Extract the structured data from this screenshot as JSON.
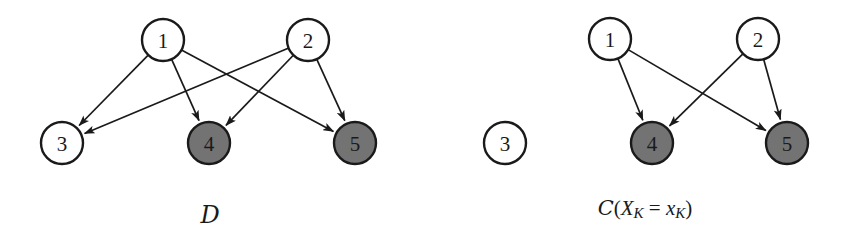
{
  "figure": {
    "background_color": "#ffffff",
    "stroke_color": "#1a1a1a",
    "observed_fill_color": "#737373",
    "unobserved_fill_color": "#ffffff",
    "node_radius": 21,
    "panels": [
      {
        "id": "panel-dag",
        "caption": "D",
        "caption_style": "calligraphic",
        "caption_x": 210,
        "caption_y": 215,
        "nodes": [
          {
            "id": "1",
            "label": "1",
            "x": 163,
            "y": 40,
            "shaded": false
          },
          {
            "id": "2",
            "label": "2",
            "x": 308,
            "y": 40,
            "shaded": false
          },
          {
            "id": "3",
            "label": "3",
            "x": 62,
            "y": 143,
            "shaded": false
          },
          {
            "id": "4",
            "label": "4",
            "x": 209,
            "y": 143,
            "shaded": true
          },
          {
            "id": "5",
            "label": "5",
            "x": 355,
            "y": 143,
            "shaded": true
          }
        ],
        "edges": [
          {
            "from": "1",
            "to": "3",
            "directed": true
          },
          {
            "from": "1",
            "to": "4",
            "directed": true
          },
          {
            "from": "1",
            "to": "5",
            "directed": true
          },
          {
            "from": "2",
            "to": "3",
            "directed": true
          },
          {
            "from": "2",
            "to": "4",
            "directed": true
          },
          {
            "from": "2",
            "to": "5",
            "directed": true
          }
        ]
      },
      {
        "id": "panel-intervened",
        "caption_parts": {
          "script_c": "C",
          "open_paren": "(",
          "var_upper": "X",
          "sub_upper": "K",
          "equals": " = ",
          "var_lower": "x",
          "sub_lower": "K",
          "close_paren": ")"
        },
        "caption_text": "C(X_K = x_K)",
        "caption_x": 645,
        "caption_y": 208,
        "nodes": [
          {
            "id": "1",
            "label": "1",
            "x": 610,
            "y": 39,
            "shaded": false
          },
          {
            "id": "2",
            "label": "2",
            "x": 758,
            "y": 39,
            "shaded": false
          },
          {
            "id": "3",
            "label": "3",
            "x": 505,
            "y": 143,
            "shaded": false
          },
          {
            "id": "4",
            "label": "4",
            "x": 652,
            "y": 143,
            "shaded": true
          },
          {
            "id": "5",
            "label": "5",
            "x": 787,
            "y": 143,
            "shaded": true
          }
        ],
        "edges": [
          {
            "from": "1",
            "to": "4",
            "directed": true
          },
          {
            "from": "1",
            "to": "5",
            "directed": true
          },
          {
            "from": "2",
            "to": "4",
            "directed": true
          },
          {
            "from": "2",
            "to": "5",
            "directed": true
          }
        ]
      }
    ]
  }
}
